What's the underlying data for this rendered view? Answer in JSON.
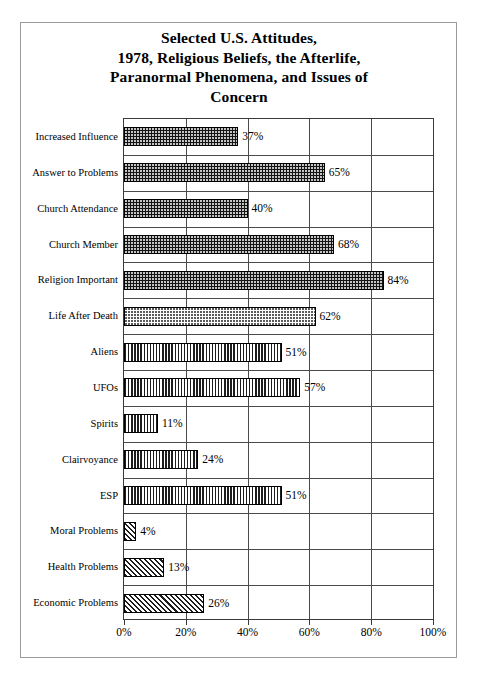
{
  "chart_data": {
    "type": "bar",
    "orientation": "horizontal",
    "title": "Selected U.S. Attitudes, 1978, Religious Beliefs, the Afterlife, Paranormal Phenomena, and Issues of Concern",
    "title_lines": [
      "Selected U.S. Attitudes,",
      "1978, Religious Beliefs, the Afterlife,",
      "Paranormal Phenomena, and Issues of",
      "Concern"
    ],
    "xlabel": "",
    "ylabel": "",
    "xlim": [
      0,
      100
    ],
    "xticks": [
      0,
      20,
      40,
      60,
      80,
      100
    ],
    "xtick_labels": [
      "0%",
      "20%",
      "40%",
      "60%",
      "80%",
      "100%"
    ],
    "grid": "both",
    "legend": "none",
    "value_label_suffix": "%",
    "categories": [
      "Increased Influence",
      "Answer to Problems",
      "Church Attendance",
      "Church Member",
      "Religion Important",
      "Life After Death",
      "Aliens",
      "UFOs",
      "Spirits",
      "Clairvoyance",
      "ESP",
      "Moral Problems",
      "Health Problems",
      "Economic Problems"
    ],
    "values": [
      37,
      65,
      40,
      68,
      84,
      62,
      51,
      57,
      11,
      24,
      51,
      4,
      13,
      26
    ],
    "value_labels": [
      "37%",
      "65%",
      "40%",
      "68%",
      "84%",
      "62%",
      "51%",
      "57%",
      "11%",
      "24%",
      "51%",
      "4%",
      "13%",
      "26%"
    ],
    "patterns": [
      "dark-dotted",
      "dark-dotted",
      "dark-dotted",
      "dark-dotted",
      "dark-dotted",
      "light-dotted",
      "vertical-stripe",
      "vertical-stripe",
      "vertical-stripe",
      "vertical-stripe",
      "vertical-stripe",
      "diagonal-hatch",
      "diagonal-hatch",
      "diagonal-hatch"
    ],
    "groups": [
      {
        "name": "Religious Beliefs",
        "pattern": "dark-dotted",
        "categories": [
          "Increased Influence",
          "Answer to Problems",
          "Church Attendance",
          "Church Member",
          "Religion Important"
        ]
      },
      {
        "name": "The Afterlife",
        "pattern": "light-dotted",
        "categories": [
          "Life After Death"
        ]
      },
      {
        "name": "Paranormal Phenomena",
        "pattern": "vertical-stripe",
        "categories": [
          "Aliens",
          "UFOs",
          "Spirits",
          "Clairvoyance",
          "ESP"
        ]
      },
      {
        "name": "Issues of Concern",
        "pattern": "diagonal-hatch",
        "categories": [
          "Moral Problems",
          "Health Problems",
          "Economic Problems"
        ]
      }
    ],
    "colors": {
      "bar_dark": "#141414",
      "bar_light": "#ffffff",
      "outline": "#000000",
      "gridline": "#4a4a4a",
      "figure_border": "#9a9a9a",
      "background": "#ffffff",
      "text": "#000000"
    }
  }
}
